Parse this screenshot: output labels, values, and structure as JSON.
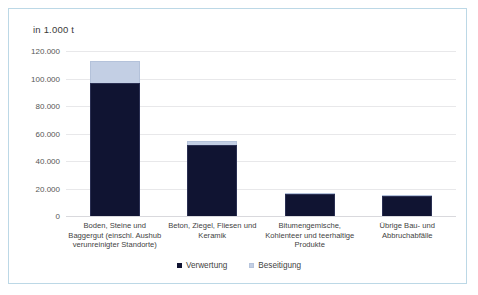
{
  "chart_data": {
    "type": "bar",
    "subtype": "stacked-vertical",
    "title": "in 1.000 t",
    "xlabel": "",
    "ylabel": "",
    "ylim": [
      0,
      120000
    ],
    "yticks": [
      "0",
      "20.000",
      "40.000",
      "60.000",
      "80.000",
      "100.000",
      "120.000"
    ],
    "ytick_values": [
      0,
      20000,
      40000,
      60000,
      80000,
      100000,
      120000
    ],
    "grid": true,
    "legend_position": "bottom",
    "categories": [
      "Boden, Steine und\nBaggergut (einschl. Aushub\nverunreinigter Standorte)",
      "Beton, Ziegel, Fliesen und\nKeramik",
      "Bitumengemische,\nKohlenteer und teerhaltige\nProdukte",
      "Übrige Bau- und\nAbbruchabfälle"
    ],
    "series": [
      {
        "name": "Verwertung",
        "color": "#101432",
        "values": [
          97000,
          51500,
          16000,
          14500
        ]
      },
      {
        "name": "Beseitigung",
        "color": "#c3cfe4",
        "values": [
          16000,
          3000,
          700,
          900
        ]
      }
    ],
    "totals": [
      113000,
      54500,
      16700,
      15400
    ]
  },
  "frame": {
    "border_color": "#bcd8e6"
  },
  "axis": {
    "gridline_color": "#e8e8ea"
  }
}
